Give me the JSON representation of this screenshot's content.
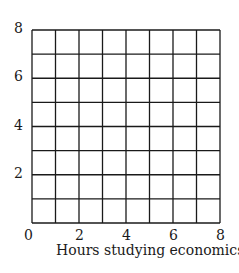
{
  "chart_data": {
    "type": "scatter",
    "title": "",
    "xlabel": "Hours studying economics",
    "ylabel": "",
    "xlim": [
      0,
      8
    ],
    "ylim": [
      0,
      8
    ],
    "grid": true,
    "grid_step": 1,
    "x_ticks": [
      0,
      2,
      4,
      6,
      8
    ],
    "y_ticks": [
      2,
      4,
      6,
      8
    ],
    "x_tick_labels": [
      "0",
      "2",
      "4",
      "6",
      "8"
    ],
    "y_tick_labels": [
      "2",
      "4",
      "6",
      "8"
    ],
    "series": [],
    "legend": null
  },
  "colors": {
    "grid": "#1a1a1a",
    "background": "#ffffff"
  }
}
